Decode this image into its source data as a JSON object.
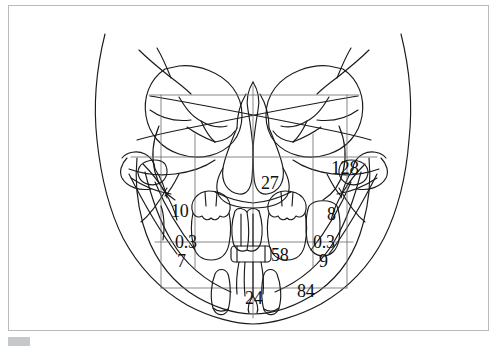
{
  "figure": {
    "type": "posteroanterior-cephalometric-tracing",
    "frame_color": "#b9bcbe",
    "line_color": "#1a1a1a",
    "background": "#ffffff"
  },
  "annotations": {
    "condyle_angle_right": "128",
    "nasal_cavity_center": "27",
    "maxilla_left": "10",
    "maxilla_right": "8",
    "molar_left": "0.3",
    "molar_right": "0.3",
    "ramus_left": "7",
    "ramus_right": "9",
    "midline_incisor": "58",
    "mandible_right": "84",
    "symphysis_center": "24"
  },
  "caption": {
    "text": "",
    "visible": false
  }
}
